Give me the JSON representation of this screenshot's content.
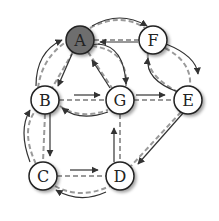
{
  "diagram": {
    "type": "graph-traversal",
    "nodes": [
      {
        "id": "A",
        "label": "A",
        "x": 80,
        "y": 40,
        "highlighted": true
      },
      {
        "id": "F",
        "label": "F",
        "x": 153,
        "y": 40,
        "highlighted": false
      },
      {
        "id": "B",
        "label": "B",
        "x": 45,
        "y": 100,
        "highlighted": false
      },
      {
        "id": "G",
        "label": "G",
        "x": 120,
        "y": 100,
        "highlighted": false
      },
      {
        "id": "E",
        "label": "E",
        "x": 188,
        "y": 100,
        "highlighted": false
      },
      {
        "id": "C",
        "label": "C",
        "x": 43,
        "y": 176,
        "highlighted": false
      },
      {
        "id": "D",
        "label": "D",
        "x": 120,
        "y": 176,
        "highlighted": false
      }
    ],
    "edges": [
      [
        "A",
        "F"
      ],
      [
        "A",
        "B"
      ],
      [
        "A",
        "G"
      ],
      [
        "F",
        "E"
      ],
      [
        "F",
        "G"
      ],
      [
        "B",
        "G"
      ],
      [
        "B",
        "C"
      ],
      [
        "G",
        "E"
      ],
      [
        "G",
        "D"
      ],
      [
        "C",
        "D"
      ],
      [
        "E",
        "D"
      ]
    ],
    "colors": {
      "highlight": "#6e6e6e",
      "edge_dash": "#9a9a9a",
      "arrow": "#333333"
    }
  }
}
